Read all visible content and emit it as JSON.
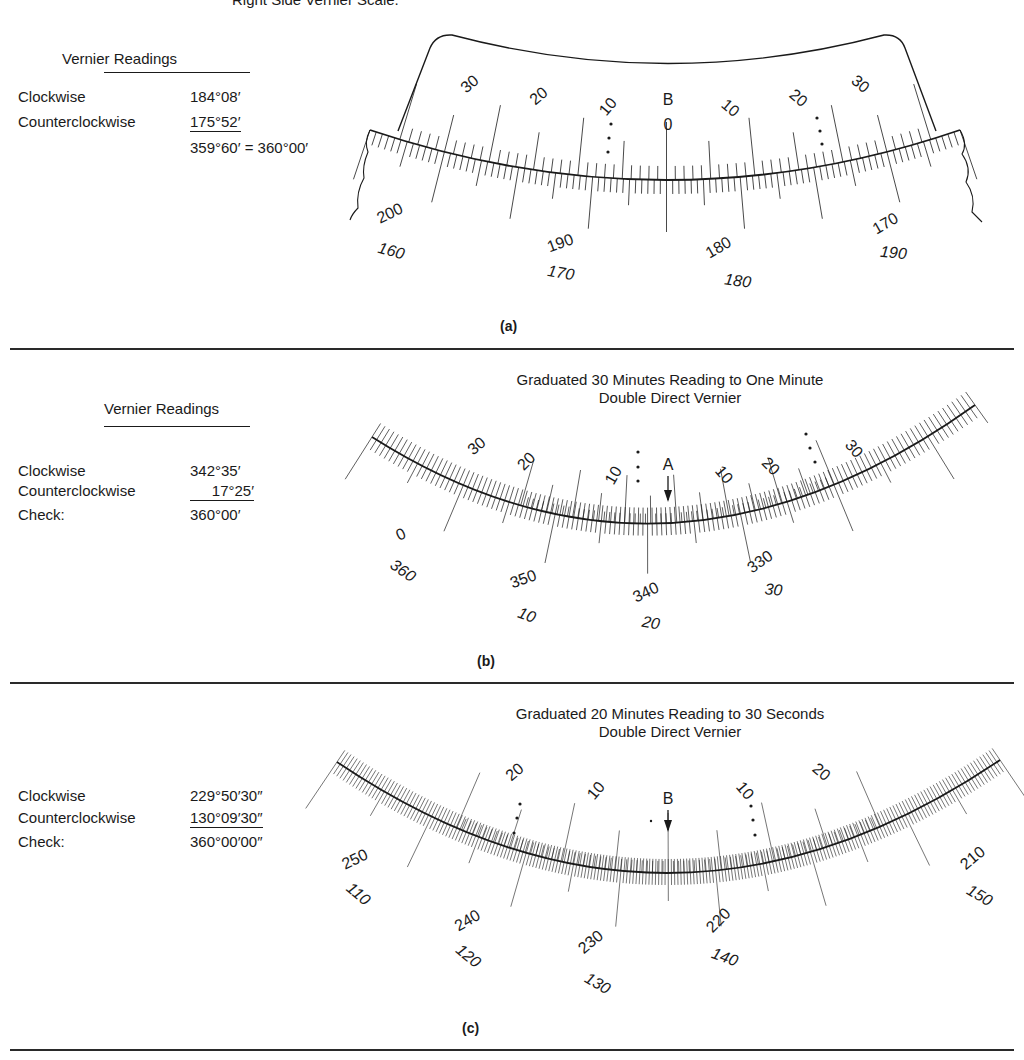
{
  "top_caption": "Right Side Vernier Scale.",
  "parts": [
    {
      "id": "a",
      "part_label": "(a)",
      "scale_title": null,
      "readings": {
        "title": "Vernier Readings",
        "rows": [
          {
            "label": "Clockwise",
            "value": "184°08′",
            "underlined": false
          },
          {
            "label": "Counterclockwise",
            "value": "175°52′",
            "underlined": true
          },
          {
            "label": "",
            "value": "359°60′ = 360°00′",
            "underlined": false
          }
        ]
      },
      "index_mark": "B",
      "vernier_labels_left": [
        "30",
        "20",
        "10"
      ],
      "vernier_zero": "0",
      "vernier_labels_right": [
        "10",
        "20",
        "30"
      ],
      "main_scale_outer": [
        "200",
        "190",
        "180",
        "170"
      ],
      "main_scale_inner": [
        "160",
        "170",
        "180",
        "190"
      ]
    },
    {
      "id": "b",
      "part_label": "(b)",
      "scale_title": [
        "Graduated 30 Minutes Reading to One Minute",
        "Double Direct Vernier"
      ],
      "readings": {
        "title": "Vernier Readings",
        "rows": [
          {
            "label": "Clockwise",
            "value": "342°35′",
            "underlined": false
          },
          {
            "label": "Counterclockwise",
            "value": "17°25′",
            "underlined": true
          },
          {
            "label": "Check:",
            "value": "360°00′",
            "underlined": false
          }
        ]
      },
      "index_mark": "A",
      "vernier_labels_left": [
        "30",
        "20",
        "10"
      ],
      "vernier_labels_right": [
        "10",
        "20",
        "30"
      ],
      "main_scale_outer": [
        "0",
        "350",
        "340",
        "330"
      ],
      "main_scale_inner": [
        "360",
        "10",
        "20",
        "30"
      ]
    },
    {
      "id": "c",
      "part_label": "(c)",
      "scale_title": [
        "Graduated 20 Minutes Reading to 30 Seconds",
        "Double Direct Vernier"
      ],
      "readings": {
        "title": null,
        "rows": [
          {
            "label": "Clockwise",
            "value": "229°50′30″",
            "underlined": false
          },
          {
            "label": "Counterclockwise",
            "value": "130°09′30″",
            "underlined": true
          },
          {
            "label": "Check:",
            "value": "360°00′00″",
            "underlined": false
          }
        ]
      },
      "index_mark": "B",
      "vernier_labels_left": [
        "20",
        "10"
      ],
      "vernier_labels_right": [
        "10",
        "20"
      ],
      "main_scale_outer": [
        "250",
        "240",
        "230",
        "220",
        "210"
      ],
      "main_scale_inner": [
        "110",
        "120",
        "130",
        "140",
        "150"
      ]
    }
  ],
  "colors": {
    "ink": "#1a1a1a",
    "paper": "#ffffff"
  }
}
